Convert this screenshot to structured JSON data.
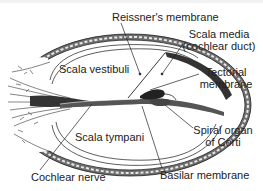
{
  "diagram": {
    "colors": {
      "background": "#ffffff",
      "ink": "#222222",
      "wall_fill": "#8a8a8a",
      "wall_dark": "#333333"
    },
    "labels": {
      "reissners_membrane": "Reissner's membrane",
      "scala_media_line1": "Scala media",
      "scala_media_line2": "(cochlear duct)",
      "scala_vestibuli": "Scala vestibuli",
      "tectorial_line1": "Tectorial",
      "tectorial_line2": "membrane",
      "scala_tympani": "Scala tympani",
      "spiral_organ_line1": "Spiral organ",
      "spiral_organ_line2": "of Corti",
      "cochlear_nerve": "Cochlear nerve",
      "basilar_membrane": "Basilar membrane"
    },
    "regions": [
      "Scala vestibuli",
      "Scala media (cochlear duct)",
      "Scala tympani"
    ],
    "structures": [
      "Reissner's membrane",
      "Tectorial membrane",
      "Spiral organ of Corti",
      "Basilar membrane",
      "Cochlear nerve"
    ]
  }
}
